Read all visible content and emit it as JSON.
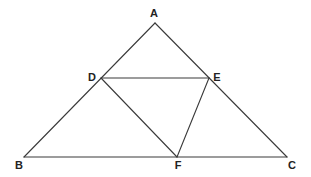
{
  "diagram": {
    "title": "",
    "points": {
      "A": {
        "label": "A",
        "x": 155,
        "y": 23,
        "lx": 154,
        "ly": 17
      },
      "B": {
        "label": "B",
        "x": 24,
        "y": 157,
        "lx": 19,
        "ly": 169
      },
      "C": {
        "label": "C",
        "x": 287,
        "y": 157,
        "lx": 292,
        "ly": 169
      },
      "D": {
        "label": "D",
        "x": 101,
        "y": 78,
        "lx": 92,
        "ly": 81
      },
      "E": {
        "label": "E",
        "x": 209,
        "y": 78,
        "lx": 217,
        "ly": 81
      },
      "F": {
        "label": "F",
        "x": 177,
        "y": 157,
        "lx": 178,
        "ly": 169
      }
    },
    "segments": [
      [
        "A",
        "B"
      ],
      [
        "A",
        "C"
      ],
      [
        "B",
        "C"
      ],
      [
        "D",
        "E"
      ],
      [
        "D",
        "F"
      ],
      [
        "E",
        "F"
      ]
    ],
    "line_color": "#3a3a3a",
    "label_color": "#222222"
  }
}
